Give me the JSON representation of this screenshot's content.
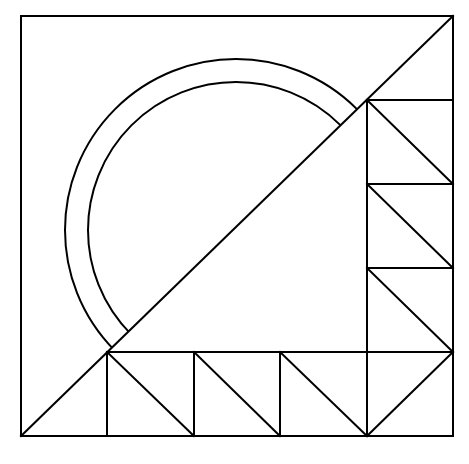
{
  "diagram": {
    "colors": {
      "stroke": "#000000",
      "background": "#ffffff"
    },
    "outer_square": {
      "x1": 21,
      "y1": 16,
      "x2": 453,
      "y2": 436
    },
    "main_diagonal": {
      "x1": 21,
      "y1": 436,
      "x2": 453,
      "y2": 16
    },
    "circle": {
      "cx": 236,
      "cy": 230,
      "outer_r": 171,
      "inner_r": 148
    },
    "grid": {
      "bottom_row": {
        "top": 352,
        "bottom": 436,
        "columns": [
          107,
          194,
          280,
          367
        ]
      },
      "right_column": {
        "left": 367,
        "right": 453,
        "rows": [
          100,
          184,
          268,
          352
        ]
      }
    },
    "bottom_triangles": [
      {
        "x1": 107,
        "y1": 352,
        "x2": 194,
        "y2": 436
      },
      {
        "x1": 194,
        "y1": 352,
        "x2": 280,
        "y2": 436
      },
      {
        "x1": 280,
        "y1": 352,
        "x2": 367,
        "y2": 436
      },
      {
        "x1": 367,
        "y1": 436,
        "x2": 453,
        "y2": 352
      }
    ],
    "right_triangles": [
      {
        "x1": 367,
        "y1": 100,
        "x2": 453,
        "y2": 184
      },
      {
        "x1": 367,
        "y1": 184,
        "x2": 453,
        "y2": 268
      },
      {
        "x1": 367,
        "y1": 268,
        "x2": 453,
        "y2": 352
      }
    ]
  }
}
